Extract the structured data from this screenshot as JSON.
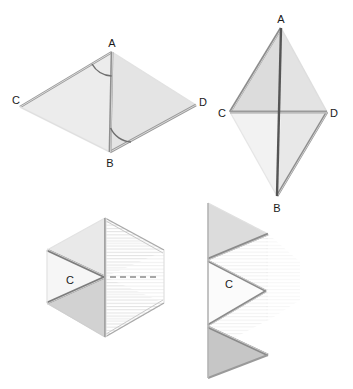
{
  "figure": {
    "background_color": "#ffffff",
    "colors": {
      "fill_light": "#ebebeb",
      "fill_mid": "#dcdcdc",
      "fill_dark": "#c6c6c6",
      "fill_pale": "#f4f4f4",
      "fill_white": "#fbfbfb",
      "stroke_dark": "#4a4a4a",
      "stroke_mid": "#8c8c8c",
      "stroke_light": "#b0b0b0",
      "label_color": "#1a1a1a",
      "hatch_color": "#d8d8d8",
      "dashed_color": "#a0a0a0"
    },
    "panels": [
      {
        "id": "panel-top-left",
        "name": "kite-perspective-view",
        "description": "Kite ABCD drawn in oblique perspective with angle arcs marked at A and B",
        "vertices": [
          {
            "label": "A",
            "x": 112,
            "y": 44,
            "label_x": 112,
            "label_y": 44
          },
          {
            "label": "B",
            "x": 110,
            "y": 157,
            "label_x": 110,
            "label_y": 157
          },
          {
            "label": "C",
            "x": 20,
            "y": 101,
            "label_x": 20,
            "label_y": 101
          },
          {
            "label": "D",
            "x": 200,
            "y": 102,
            "label_x": 200,
            "label_y": 102
          }
        ],
        "angle_marks": [
          {
            "at": "A",
            "type": "arc"
          },
          {
            "at": "B",
            "type": "arc"
          }
        ]
      },
      {
        "id": "panel-top-right",
        "name": "kite-front-view",
        "description": "Kite ABCD seen flat with diagonals AB and CD both drawn",
        "vertices": [
          {
            "label": "A",
            "x": 281,
            "y": 20,
            "label_x": 281,
            "label_y": 20
          },
          {
            "label": "B",
            "x": 277,
            "y": 203,
            "label_x": 277,
            "label_y": 203
          },
          {
            "label": "C",
            "x": 222,
            "y": 113,
            "label_x": 222,
            "label_y": 113
          },
          {
            "label": "D",
            "x": 333,
            "y": 113,
            "label_x": 333,
            "label_y": 113
          }
        ],
        "angle_marks": []
      },
      {
        "id": "panel-bottom-left",
        "name": "kite-partially-folded",
        "description": "Kite folded along diagonal AB, hexagonal silhouette with dashed fold line and label C",
        "vertices": [
          {
            "label": "C",
            "x": 70,
            "y": 281,
            "label_x": 70,
            "label_y": 281
          }
        ],
        "angle_marks": []
      },
      {
        "id": "panel-bottom-right",
        "name": "kite-fully-folded",
        "description": "Kite folded flat into a zigzag of stacked triangles with label C",
        "vertices": [
          {
            "label": "C",
            "x": 229,
            "y": 285,
            "label_x": 229,
            "label_y": 285
          }
        ],
        "angle_marks": []
      }
    ]
  }
}
